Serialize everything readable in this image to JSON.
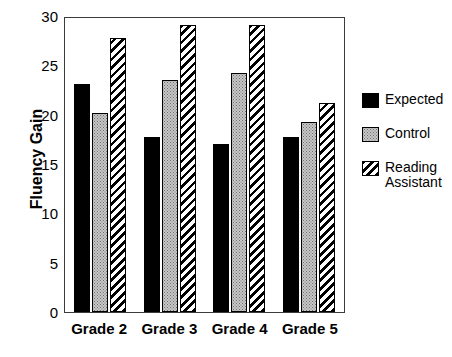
{
  "chart_data": {
    "type": "bar",
    "title": "",
    "xlabel": "",
    "ylabel": "Fluency Gain",
    "categories": [
      "Grade 2",
      "Grade 3",
      "Grade 4",
      "Grade 5"
    ],
    "series": [
      {
        "name": "Expected",
        "fill": "solid-black",
        "color": "#000000",
        "values": [
          23.3,
          17.9,
          17.1,
          17.9
        ]
      },
      {
        "name": "Control",
        "fill": "gray-dotted",
        "color": "#c8c8c8",
        "values": [
          20.3,
          23.7,
          24.4,
          19.4
        ]
      },
      {
        "name": "Reading\nAssistant",
        "fill": "diagonal-hatch",
        "color": "#ffffff",
        "values": [
          28.0,
          29.3,
          29.3,
          21.3
        ]
      }
    ],
    "ylim": [
      0,
      30
    ],
    "yticks": [
      "0",
      "5",
      "10",
      "15",
      "20",
      "25",
      "30"
    ],
    "grid": false,
    "legend_position": "right"
  },
  "axis": {
    "y_title": "Fluency Gain"
  },
  "legend": {
    "items": [
      {
        "label": "Expected"
      },
      {
        "label": "Control"
      },
      {
        "label": "Reading\nAssistant"
      }
    ]
  }
}
